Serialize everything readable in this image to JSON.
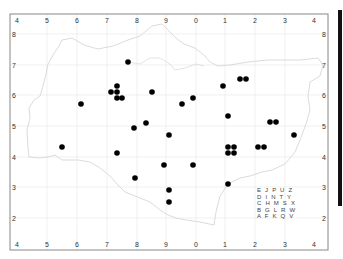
{
  "map": {
    "type": "distribution-map",
    "frame": {
      "left": 10,
      "top": 14,
      "right": 328,
      "bottom": 250
    },
    "colors": {
      "frame": "#888888",
      "grid": "#e6e6e6",
      "coast": "#d2d2d2",
      "dot": "#000000",
      "background": "#ffffff"
    },
    "x_ticks": [
      {
        "label": "4",
        "x": 17
      },
      {
        "label": "5",
        "x": 47
      },
      {
        "label": "6",
        "x": 77
      },
      {
        "label": "7",
        "x": 107
      },
      {
        "label": "8",
        "x": 137
      },
      {
        "label": "9",
        "x": 166
      },
      {
        "label": "0",
        "x": 196
      },
      {
        "label": "1",
        "x": 225
      },
      {
        "label": "2",
        "x": 255
      },
      {
        "label": "3",
        "x": 285
      },
      {
        "label": "4",
        "x": 314
      }
    ],
    "y_ticks": [
      {
        "label": "8",
        "y": 34
      },
      {
        "label": "7",
        "y": 65
      },
      {
        "label": "6",
        "y": 95
      },
      {
        "label": "5",
        "y": 126
      },
      {
        "label": "4",
        "y": 157
      },
      {
        "label": "3",
        "y": 187
      },
      {
        "label": "2",
        "y": 218
      }
    ],
    "records": [
      [
        128,
        62
      ],
      [
        117,
        86
      ],
      [
        111,
        92
      ],
      [
        117,
        92
      ],
      [
        117,
        98
      ],
      [
        122,
        98
      ],
      [
        152,
        92
      ],
      [
        81,
        104
      ],
      [
        223,
        86
      ],
      [
        240,
        79
      ],
      [
        246,
        79
      ],
      [
        193,
        98
      ],
      [
        182,
        104
      ],
      [
        228,
        116
      ],
      [
        270,
        122
      ],
      [
        276,
        122
      ],
      [
        146,
        123
      ],
      [
        134,
        128
      ],
      [
        169,
        135
      ],
      [
        294,
        135
      ],
      [
        62,
        147
      ],
      [
        117,
        153
      ],
      [
        228,
        147
      ],
      [
        234,
        147
      ],
      [
        228,
        153
      ],
      [
        234,
        153
      ],
      [
        258,
        147
      ],
      [
        264,
        147
      ],
      [
        164,
        165
      ],
      [
        193,
        165
      ],
      [
        135,
        178
      ],
      [
        228,
        184
      ],
      [
        169,
        190
      ],
      [
        169,
        202
      ]
    ],
    "tetrad_legend": {
      "rows": [
        "E J P U Z",
        "D I N T Y",
        "C H M S X",
        "B G L R W",
        "A F K Q V"
      ]
    }
  }
}
